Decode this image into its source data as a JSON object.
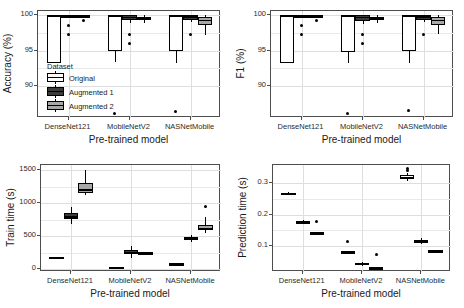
{
  "figure": {
    "background": "#ffffff",
    "panel_border": "#4d4d4d",
    "grid_color": "#e9e9e9"
  },
  "legend": {
    "title": "Dataset",
    "items": [
      {
        "label": "Original",
        "color": "#ffffff"
      },
      {
        "label": "Augmented 1",
        "color": "#3a3a3a"
      },
      {
        "label": "Augmented 2",
        "color": "#a8a8a8"
      }
    ]
  },
  "chart_data": [
    {
      "id": "accuracy",
      "type": "bar",
      "subtype": "boxplot",
      "title": "",
      "xlabel": "Pre-trained model",
      "ylabel": "Accuracy (%)",
      "categories": [
        "DenseNet121",
        "MobileNetV2",
        "NASNetMobile"
      ],
      "yticks": [
        90,
        95,
        100
      ],
      "ylim": [
        85.5,
        100.6
      ],
      "grid": true,
      "legend_position": "inside-bottom-left",
      "series": [
        {
          "name": "Original",
          "color": "#ffffff",
          "boxes": [
            {
              "category": "DenseNet121",
              "lower_whisker": 93.3,
              "q1": 93.3,
              "median": 100.0,
              "q3": 100.0,
              "upper_whisker": 100.0,
              "outliers": []
            },
            {
              "category": "MobileNetV2",
              "lower_whisker": 93.4,
              "q1": 94.9,
              "median": 100.0,
              "q3": 100.0,
              "upper_whisker": 100.0,
              "outliers": [
                86.2
              ]
            },
            {
              "category": "NASNetMobile",
              "lower_whisker": 93.3,
              "q1": 95.0,
              "median": 100.0,
              "q3": 100.0,
              "upper_whisker": 100.0,
              "outliers": [
                86.4
              ]
            }
          ]
        },
        {
          "name": "Augmented 1",
          "color": "#3a3a3a",
          "boxes": [
            {
              "category": "DenseNet121",
              "lower_whisker": 100.0,
              "q1": 100.0,
              "median": 100.0,
              "q3": 100.0,
              "upper_whisker": 100.0,
              "outliers": [
                98.6,
                97.3
              ]
            },
            {
              "category": "MobileNetV2",
              "lower_whisker": 98.9,
              "q1": 99.3,
              "median": 99.8,
              "q3": 100.0,
              "upper_whisker": 100.0,
              "outliers": [
                97.3,
                96.0
              ]
            },
            {
              "category": "NASNetMobile",
              "lower_whisker": 99.0,
              "q1": 99.4,
              "median": 99.9,
              "q3": 100.0,
              "upper_whisker": 100.0,
              "outliers": [
                97.3
              ]
            }
          ]
        },
        {
          "name": "Augmented 2",
          "color": "#a8a8a8",
          "boxes": [
            {
              "category": "DenseNet121",
              "lower_whisker": 100.0,
              "q1": 100.0,
              "median": 100.0,
              "q3": 100.0,
              "upper_whisker": 100.0,
              "outliers": [
                99.3
              ]
            },
            {
              "category": "MobileNetV2",
              "lower_whisker": 98.9,
              "q1": 99.4,
              "median": 99.6,
              "q3": 99.8,
              "upper_whisker": 100.0,
              "outliers": []
            },
            {
              "category": "NASNetMobile",
              "lower_whisker": 97.2,
              "q1": 98.6,
              "median": 99.4,
              "q3": 99.7,
              "upper_whisker": 100.0,
              "outliers": []
            }
          ]
        }
      ]
    },
    {
      "id": "f1",
      "type": "bar",
      "subtype": "boxplot",
      "title": "",
      "xlabel": "Pre-trained model",
      "ylabel": "F1 (%)",
      "categories": [
        "DenseNet121",
        "MobileNetV2",
        "NASNetMobile"
      ],
      "yticks": [
        90,
        95,
        100
      ],
      "ylim": [
        85.5,
        100.6
      ],
      "grid": true,
      "legend_position": "none",
      "series": [
        {
          "name": "Original",
          "color": "#ffffff",
          "boxes": [
            {
              "category": "DenseNet121",
              "lower_whisker": 93.2,
              "q1": 93.2,
              "median": 100.0,
              "q3": 100.0,
              "upper_whisker": 100.0,
              "outliers": []
            },
            {
              "category": "MobileNetV2",
              "lower_whisker": 93.2,
              "q1": 94.8,
              "median": 100.0,
              "q3": 100.0,
              "upper_whisker": 100.0,
              "outliers": [
                86.1
              ]
            },
            {
              "category": "NASNetMobile",
              "lower_whisker": 93.3,
              "q1": 94.9,
              "median": 100.0,
              "q3": 100.0,
              "upper_whisker": 100.0,
              "outliers": [
                86.5
              ]
            }
          ]
        },
        {
          "name": "Augmented 1",
          "color": "#3a3a3a",
          "boxes": [
            {
              "category": "DenseNet121",
              "lower_whisker": 100.0,
              "q1": 100.0,
              "median": 100.0,
              "q3": 100.0,
              "upper_whisker": 100.0,
              "outliers": [
                98.6,
                97.3
              ]
            },
            {
              "category": "MobileNetV2",
              "lower_whisker": 98.8,
              "q1": 99.2,
              "median": 99.8,
              "q3": 100.0,
              "upper_whisker": 100.0,
              "outliers": [
                97.3,
                96.0
              ]
            },
            {
              "category": "NASNetMobile",
              "lower_whisker": 99.0,
              "q1": 99.4,
              "median": 99.9,
              "q3": 100.0,
              "upper_whisker": 100.0,
              "outliers": [
                97.3
              ]
            }
          ]
        },
        {
          "name": "Augmented 2",
          "color": "#a8a8a8",
          "boxes": [
            {
              "category": "DenseNet121",
              "lower_whisker": 100.0,
              "q1": 100.0,
              "median": 100.0,
              "q3": 100.0,
              "upper_whisker": 100.0,
              "outliers": [
                99.3
              ]
            },
            {
              "category": "MobileNetV2",
              "lower_whisker": 98.9,
              "q1": 99.4,
              "median": 99.6,
              "q3": 99.8,
              "upper_whisker": 100.0,
              "outliers": []
            },
            {
              "category": "NASNetMobile",
              "lower_whisker": 97.3,
              "q1": 98.6,
              "median": 99.4,
              "q3": 99.7,
              "upper_whisker": 100.0,
              "outliers": []
            }
          ]
        }
      ]
    },
    {
      "id": "train_time",
      "type": "bar",
      "subtype": "boxplot",
      "title": "",
      "xlabel": "Pre-trained model",
      "ylabel": "Train time (s)",
      "categories": [
        "DenseNet121",
        "MobileNetV2",
        "NASNetMobile"
      ],
      "yticks": [
        0,
        500,
        1000,
        1500
      ],
      "ylim": [
        -40,
        1580
      ],
      "grid": true,
      "legend_position": "none",
      "series": [
        {
          "name": "Original",
          "color": "#ffffff",
          "boxes": [
            {
              "category": "DenseNet121",
              "lower_whisker": 165,
              "q1": 172,
              "median": 180,
              "q3": 190,
              "upper_whisker": 198,
              "outliers": []
            },
            {
              "category": "MobileNetV2",
              "lower_whisker": 25,
              "q1": 30,
              "median": 36,
              "q3": 42,
              "upper_whisker": 48,
              "outliers": []
            },
            {
              "category": "NASNetMobile",
              "lower_whisker": 72,
              "q1": 80,
              "median": 88,
              "q3": 96,
              "upper_whisker": 104,
              "outliers": []
            }
          ]
        },
        {
          "name": "Augmented 1",
          "color": "#3a3a3a",
          "boxes": [
            {
              "category": "DenseNet121",
              "lower_whisker": 690,
              "q1": 755,
              "median": 805,
              "q3": 860,
              "upper_whisker": 940,
              "outliers": []
            },
            {
              "category": "MobileNetV2",
              "lower_whisker": 175,
              "q1": 225,
              "median": 258,
              "q3": 292,
              "upper_whisker": 360,
              "outliers": []
            },
            {
              "category": "NASNetMobile",
              "lower_whisker": 420,
              "q1": 450,
              "median": 470,
              "q3": 490,
              "upper_whisker": 520,
              "outliers": []
            }
          ]
        },
        {
          "name": "Augmented 2",
          "color": "#a8a8a8",
          "boxes": [
            {
              "category": "DenseNet121",
              "lower_whisker": 1130,
              "q1": 1160,
              "median": 1215,
              "q3": 1300,
              "upper_whisker": 1510,
              "outliers": []
            },
            {
              "category": "MobileNetV2",
              "lower_whisker": 240,
              "q1": 248,
              "median": 255,
              "q3": 262,
              "upper_whisker": 270,
              "outliers": []
            },
            {
              "category": "NASNetMobile",
              "lower_whisker": 545,
              "q1": 595,
              "median": 630,
              "q3": 665,
              "upper_whisker": 790,
              "outliers": [
                945
              ]
            }
          ]
        }
      ]
    },
    {
      "id": "prediction_time",
      "type": "bar",
      "subtype": "boxplot",
      "title": "",
      "xlabel": "Pre-trained model",
      "ylabel": "Prediction time (s)",
      "categories": [
        "DenseNet121",
        "MobileNetV2",
        "NASNetMobile"
      ],
      "yticks": [
        0.1,
        0.2,
        0.3
      ],
      "ylim": [
        0.02,
        0.355
      ],
      "grid": true,
      "legend_position": "none",
      "series": [
        {
          "name": "Original",
          "color": "#ffffff",
          "boxes": [
            {
              "category": "DenseNet121",
              "lower_whisker": 0.262,
              "q1": 0.264,
              "median": 0.266,
              "q3": 0.268,
              "upper_whisker": 0.27,
              "outliers": []
            },
            {
              "category": "MobileNetV2",
              "lower_whisker": 0.08,
              "q1": 0.081,
              "median": 0.083,
              "q3": 0.085,
              "upper_whisker": 0.086,
              "outliers": [
                0.117
              ]
            },
            {
              "category": "NASNetMobile",
              "lower_whisker": 0.305,
              "q1": 0.312,
              "median": 0.318,
              "q3": 0.324,
              "upper_whisker": 0.33,
              "outliers": [
                0.344,
                0.337
              ]
            }
          ]
        },
        {
          "name": "Augmented 1",
          "color": "#3a3a3a",
          "boxes": [
            {
              "category": "DenseNet121",
              "lower_whisker": 0.17,
              "q1": 0.173,
              "median": 0.176,
              "q3": 0.179,
              "upper_whisker": 0.182,
              "outliers": []
            },
            {
              "category": "MobileNetV2",
              "lower_whisker": 0.04,
              "q1": 0.043,
              "median": 0.046,
              "q3": 0.049,
              "upper_whisker": 0.052,
              "outliers": []
            },
            {
              "category": "NASNetMobile",
              "lower_whisker": 0.109,
              "q1": 0.113,
              "median": 0.117,
              "q3": 0.121,
              "upper_whisker": 0.126,
              "outliers": []
            }
          ]
        },
        {
          "name": "Augmented 2",
          "color": "#a8a8a8",
          "boxes": [
            {
              "category": "DenseNet121",
              "lower_whisker": 0.141,
              "q1": 0.142,
              "median": 0.143,
              "q3": 0.144,
              "upper_whisker": 0.146,
              "outliers": [
                0.178
              ]
            },
            {
              "category": "MobileNetV2",
              "lower_whisker": 0.032,
              "q1": 0.033,
              "median": 0.034,
              "q3": 0.035,
              "upper_whisker": 0.036,
              "outliers": [
                0.075
              ]
            },
            {
              "category": "NASNetMobile",
              "lower_whisker": 0.085,
              "q1": 0.086,
              "median": 0.087,
              "q3": 0.088,
              "upper_whisker": 0.089,
              "outliers": []
            }
          ]
        }
      ]
    }
  ]
}
